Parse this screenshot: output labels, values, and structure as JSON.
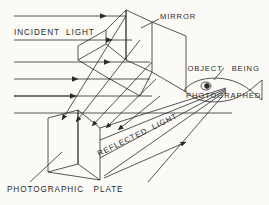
{
  "diagram": {
    "background_color": "#fbfaf7",
    "ink_color": "#2b2b2b",
    "labels": {
      "incident_light": "INCIDENT  LIGHT",
      "mirror": "MIRROR",
      "object_line1": "OBJECT   BEING",
      "object_line2": "PHOTOGRAPHED",
      "photographic_plate": "PHOTOGRAPHIC   PLATE",
      "reflected_light": "REFLECTED  LIGHT"
    },
    "elements": {
      "mirror_name": "mirror-plane",
      "plate_name": "photographic-plate",
      "object_name": "fish-object",
      "incident_rays_count": 5,
      "reflected_rays_count": 5,
      "converging_rays_count": 4
    }
  }
}
